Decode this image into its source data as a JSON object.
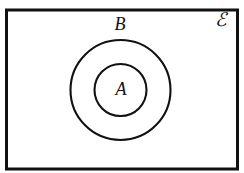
{
  "diagram": {
    "kind": "euler-diagram",
    "background_color": "#ffffff",
    "stroke_color": "#111111",
    "fill_color": "#ffffff",
    "universe": {
      "label": "ℰ",
      "name": "universal-set",
      "shape": "rectangle",
      "x": 6.5,
      "y": 10,
      "width": 231,
      "height": 159,
      "stroke_width": 3,
      "label_x": 221,
      "label_y": 22
    },
    "sets": [
      {
        "label": "B",
        "name": "set-b",
        "shape": "circle",
        "cx": 120.5,
        "cy": 90,
        "r": 50,
        "stroke_width": 2.1,
        "label_x": 120,
        "label_y": 26,
        "label_position": "above-top-arc"
      },
      {
        "label": "A",
        "name": "set-a",
        "shape": "circle",
        "cx": 120.5,
        "cy": 90,
        "r": 26,
        "stroke_width": 2.1,
        "label_x": 121,
        "label_y": 91,
        "label_position": "center"
      }
    ],
    "relation": "A ⊂ B ⊂ ℰ"
  }
}
